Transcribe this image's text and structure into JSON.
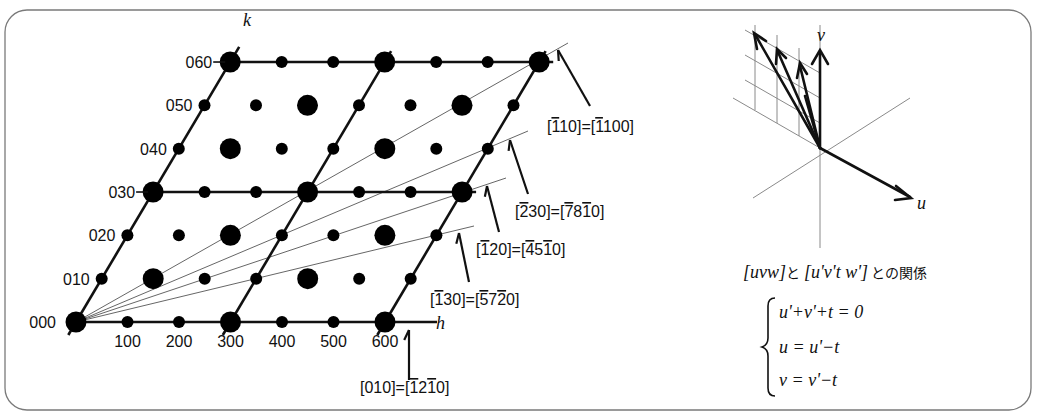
{
  "figure": {
    "frame": {
      "stroke": "#7a7a7a",
      "radius": 22
    },
    "lattice": {
      "origin": [
        76,
        322
      ],
      "h_step": [
        51.5,
        0
      ],
      "k_step": [
        25.7,
        -43.33
      ],
      "h_range": [
        0,
        6
      ],
      "k_range": [
        0,
        6
      ],
      "axis_labels": {
        "h": "h",
        "k": "k"
      },
      "h_tick_labels": [
        "100",
        "200",
        "300",
        "400",
        "500",
        "600"
      ],
      "k_tick_labels": [
        "000",
        "010",
        "020",
        "030",
        "040",
        "050",
        "060"
      ],
      "big_spot_rule": "(h - k) mod 3 == 0",
      "cell_lines": "h = 0,3,6 and k = 0,3,6",
      "directions": [
        {
          "id": "d110",
          "through": [
            6,
            6
          ],
          "end": [
            568,
            43
          ],
          "arrow_from": [
            590,
            106
          ],
          "arrow_to": [
            558,
            50
          ],
          "label_x": 547,
          "label_y": 132,
          "label": [
            {
              "t": "[",
              "b": false
            },
            {
              "t": "1",
              "b": true
            },
            {
              "t": "10]=[",
              "b": false
            },
            {
              "t": "1",
              "b": true
            },
            {
              "t": "100]",
              "b": false
            }
          ]
        },
        {
          "id": "d230",
          "through": [
            6,
            4
          ],
          "end": [
            528,
            131
          ],
          "arrow_from": [
            528,
            194
          ],
          "arrow_to": [
            510,
            140
          ],
          "label_x": 515,
          "label_y": 217,
          "label": [
            {
              "t": "[",
              "b": false
            },
            {
              "t": "2",
              "b": true
            },
            {
              "t": "30]=[",
              "b": false
            },
            {
              "t": "7",
              "b": true
            },
            {
              "t": "8",
              "b": false
            },
            {
              "t": "1",
              "b": true
            },
            {
              "t": "0]",
              "b": false
            }
          ]
        },
        {
          "id": "d120",
          "through": [
            6,
            3
          ],
          "end": [
            506,
            178
          ],
          "arrow_from": [
            499,
            232
          ],
          "arrow_to": [
            487,
            186
          ],
          "label_x": 476,
          "label_y": 255,
          "label": [
            {
              "t": "[",
              "b": false
            },
            {
              "t": "1",
              "b": true
            },
            {
              "t": "20]=[",
              "b": false
            },
            {
              "t": "4",
              "b": true
            },
            {
              "t": "5",
              "b": false
            },
            {
              "t": "1",
              "b": true
            },
            {
              "t": "0]",
              "b": false
            }
          ]
        },
        {
          "id": "d130",
          "through": [
            6,
            2
          ],
          "end": [
            474,
            226
          ],
          "arrow_from": [
            469,
            282
          ],
          "arrow_to": [
            459,
            233
          ],
          "label_x": 430,
          "label_y": 305,
          "label": [
            {
              "t": "[",
              "b": false
            },
            {
              "t": "1",
              "b": true
            },
            {
              "t": "30]=[",
              "b": false
            },
            {
              "t": "5",
              "b": true
            },
            {
              "t": "7",
              "b": false
            },
            {
              "t": "2",
              "b": true
            },
            {
              "t": "0]",
              "b": false
            }
          ]
        },
        {
          "id": "d010",
          "through": [
            6,
            0
          ],
          "end": [
            385,
            322
          ],
          "arrow_from": [
            409,
            380
          ],
          "arrow_to": [
            409,
            330
          ],
          "label_x": 360,
          "label_y": 393,
          "label": [
            {
              "t": "[010]=[",
              "b": false
            },
            {
              "t": "1",
              "b": true
            },
            {
              "t": "2",
              "b": false
            },
            {
              "t": "1",
              "b": true
            },
            {
              "t": "0]",
              "b": false
            }
          ]
        }
      ]
    },
    "hex_vectors": {
      "origin": [
        820,
        148
      ],
      "axis_labels": {
        "u": "u",
        "v": "v"
      },
      "caption_parts": [
        "[uvw]",
        "と",
        "[u'v't w']",
        "との関係"
      ],
      "equations": [
        "u'+v'+t = 0",
        "u = u'−t",
        "v = v'−t"
      ]
    }
  }
}
